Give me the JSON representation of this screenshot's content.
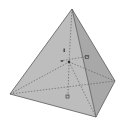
{
  "diagram": {
    "type": "tetrahedron",
    "colors": {
      "background": "#ffffff",
      "face_front": "#b8b8b8",
      "face_right": "#a9a9a9",
      "face_left": "#c4c4c4",
      "edge": "#5a5a5a",
      "hidden_edge": "#555555",
      "marker": "#444444"
    },
    "vertices": {
      "apex": [
        72,
        9
      ],
      "left": [
        10,
        94
      ],
      "front": [
        96,
        117
      ],
      "right": [
        115,
        81
      ]
    },
    "center": [
      69,
      62
    ],
    "labels": [
      {
        "id": "marker-upper",
        "glyph": "▫",
        "pos": [
          87,
          57
        ]
      },
      {
        "id": "marker-lower",
        "glyph": "▫",
        "pos": [
          67,
          97
        ]
      },
      {
        "id": "marker-left",
        "glyph": "•",
        "pos": [
          62,
          61
        ]
      },
      {
        "id": "marker-top",
        "glyph": "ᵗ",
        "pos": [
          64,
          51
        ]
      }
    ]
  }
}
